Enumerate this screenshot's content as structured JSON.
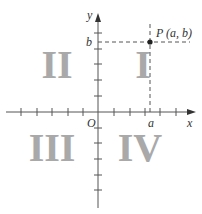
{
  "diagram": {
    "axes": {
      "x_label": "x",
      "y_label": "y",
      "origin_label": "O",
      "x_ticks": [
        -5,
        -4,
        -3,
        -2,
        -1,
        1,
        2,
        3,
        4,
        5
      ],
      "y_ticks": [
        -5,
        -4,
        -3,
        -2,
        -1,
        1,
        2,
        3,
        4,
        5
      ]
    },
    "point": {
      "label": "P (a, b)",
      "x_label": "a",
      "y_label": "b"
    },
    "quadrants": [
      {
        "id": "I",
        "label": "I"
      },
      {
        "id": "II",
        "label": "II"
      },
      {
        "id": "III",
        "label": "III"
      },
      {
        "id": "IV",
        "label": "IV"
      }
    ],
    "colors": {
      "axis": "#555555",
      "quadrant_numeral": "#a9a9a9",
      "point": "#222222"
    }
  }
}
